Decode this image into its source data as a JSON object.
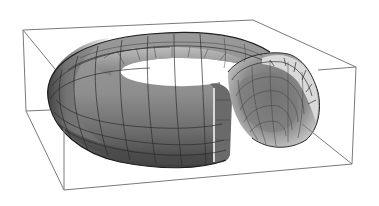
{
  "figure": {
    "title": "",
    "object": "torus-with-cutout",
    "colors": {
      "background": "#ffffff",
      "box_edge": "#7a7a7a",
      "surface_mid": "#8c8c8c",
      "surface_dark": "#4a4a4a",
      "surface_light": "#d6d6d6",
      "mesh_line": "#2a2a2a"
    },
    "bounding_box": {
      "top_left_back": [
        23,
        30
      ],
      "top_right_back": [
        253,
        20
      ],
      "top_right_front": [
        356,
        67
      ],
      "bottom_right_front": [
        352,
        164
      ],
      "bottom_left_front": [
        64,
        190
      ],
      "left_mid": [
        26,
        111
      ]
    }
  }
}
